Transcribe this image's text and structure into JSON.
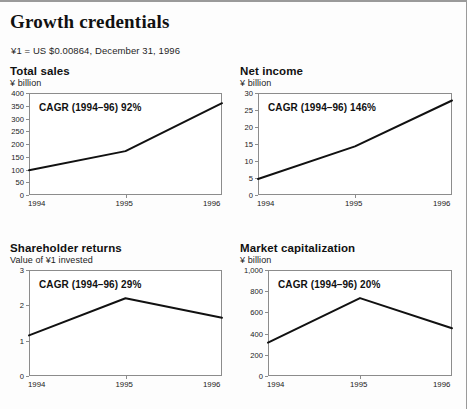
{
  "header": {
    "title": "Growth credentials",
    "fx_note": "¥1 = US $0.00864, December 31, 1996"
  },
  "chart_data": [
    {
      "id": "total-sales",
      "type": "line",
      "title": "Total sales",
      "ylabel": "¥ billion",
      "annotation": "CAGR (1994–96) 92%",
      "categories": [
        "1994",
        "1995",
        "1996"
      ],
      "values": [
        97,
        172,
        360
      ],
      "ylim": [
        0,
        400
      ],
      "yticks": [
        0,
        50,
        100,
        150,
        200,
        250,
        300,
        350,
        400
      ],
      "ytick_labels": [
        "0",
        "50",
        "100",
        "150",
        "200",
        "250",
        "300",
        "350",
        "400"
      ],
      "grid": false
    },
    {
      "id": "net-income",
      "type": "line",
      "title": "Net income",
      "ylabel": "¥ billion",
      "annotation": "CAGR (1994–96) 146%",
      "categories": [
        "1994",
        "1995",
        "1996"
      ],
      "values": [
        4.7,
        14.3,
        27.8
      ],
      "ylim": [
        0,
        30
      ],
      "yticks": [
        0,
        5,
        10,
        15,
        20,
        25,
        30
      ],
      "ytick_labels": [
        "0",
        "5",
        "10",
        "15",
        "20",
        "25",
        "30"
      ],
      "grid": false
    },
    {
      "id": "shareholder-returns",
      "type": "line",
      "title": "Shareholder returns",
      "ylabel": "Value of ¥1 invested",
      "annotation": "CAGR (1994–96) 29%",
      "categories": [
        "1994",
        "1995",
        "1996"
      ],
      "values": [
        1.15,
        2.2,
        1.65
      ],
      "ylim": [
        0,
        3
      ],
      "yticks": [
        0,
        1,
        2,
        3
      ],
      "ytick_labels": [
        "0",
        "1",
        "2",
        "3"
      ],
      "grid": false
    },
    {
      "id": "market-capitalization",
      "type": "line",
      "title": "Market capitalization",
      "ylabel": "¥ billion",
      "annotation": "CAGR (1994–96) 20%",
      "categories": [
        "1994",
        "1995",
        "1996"
      ],
      "values": [
        315,
        735,
        450
      ],
      "ylim": [
        0,
        1000
      ],
      "yticks": [
        0,
        200,
        400,
        600,
        800,
        1000
      ],
      "ytick_labels": [
        "0",
        "200",
        "400",
        "600",
        "800",
        "1,000"
      ],
      "grid": false
    }
  ],
  "style": {
    "line_color": "#111111",
    "frame_color": "#8c8c8c",
    "text_color": "#1a1a1a"
  }
}
